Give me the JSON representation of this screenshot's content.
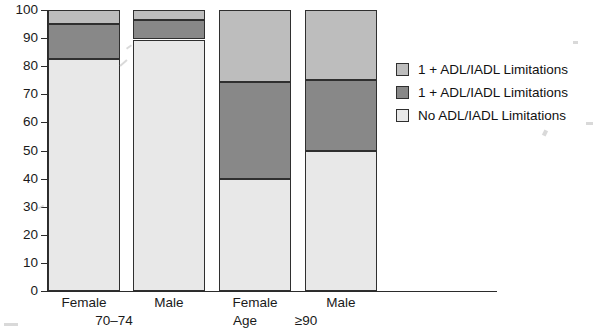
{
  "chart_data": {
    "type": "bar",
    "subtype": "stacked-percentage",
    "title": "",
    "xlabel": "Age",
    "ylabel": "",
    "ylim": [
      0,
      100
    ],
    "yticks": [
      0,
      10,
      20,
      30,
      40,
      50,
      60,
      70,
      80,
      90,
      100
    ],
    "ytick_labels": [
      "0",
      "10",
      "20",
      "30",
      "40",
      "50",
      "60",
      "70",
      "80",
      "90",
      "100"
    ],
    "grid": false,
    "legend_position": "right",
    "categories": [
      "Female",
      "Male",
      "Female",
      "Male"
    ],
    "groups": [
      {
        "label": "70–74",
        "categories": [
          "Female",
          "Male"
        ]
      },
      {
        "label": "≥90",
        "categories": [
          "Female",
          "Male"
        ]
      }
    ],
    "series": [
      {
        "name": "No ADL/IADL Limitations",
        "color": "#e8e8e8",
        "values": [
          82.5,
          89.5,
          40.0,
          50.0
        ]
      },
      {
        "name": "1 + ADL/IADL Limitations",
        "color": "#888888",
        "values": [
          12.5,
          7.0,
          34.5,
          25.0
        ]
      },
      {
        "name": "1 + ADL/IADL Limitations",
        "color": "#bdbdbd",
        "values": [
          5.0,
          3.5,
          25.5,
          25.0
        ]
      }
    ],
    "bars": [
      {
        "category": "Female",
        "group": "70–74",
        "stack": [
          82.5,
          95.0,
          100.0
        ]
      },
      {
        "category": "Male",
        "group": "70–74",
        "stack": [
          89.5,
          96.5,
          100.0
        ]
      },
      {
        "category": "Female",
        "group": "≥90",
        "stack": [
          40.0,
          74.5,
          100.0
        ]
      },
      {
        "category": "Male",
        "group": "≥90",
        "stack": [
          50.0,
          75.0,
          100.0
        ]
      }
    ]
  },
  "legend": {
    "items": [
      {
        "label": "1 + ADL/IADL Limitations",
        "color": "#bdbdbd"
      },
      {
        "label": "1 + ADL/IADL Limitations",
        "color": "#888888"
      },
      {
        "label": "No ADL/IADL Limitations",
        "color": "#e8e8e8"
      }
    ]
  },
  "axes": {
    "x_title": "Age",
    "x_category_labels": [
      "Female",
      "Male",
      "Female",
      "Male"
    ],
    "x_group_labels": [
      "70–74",
      "≥90"
    ],
    "y_tick_labels": [
      "100",
      "90",
      "80",
      "70",
      "60",
      "50",
      "40",
      "30",
      "20",
      "10",
      "0"
    ]
  },
  "colors": {
    "axis": "#2b2b2b",
    "bar_border": "#2f2f2f",
    "segment_light": "#e8e8e8",
    "segment_mid": "#888888",
    "segment_top": "#bdbdbd",
    "background": "#ffffff"
  }
}
